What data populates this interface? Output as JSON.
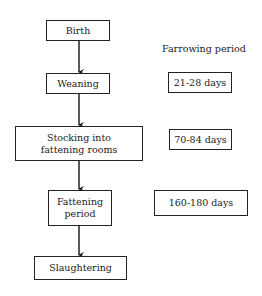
{
  "flow": {
    "steps": [
      {
        "label": "Birth"
      },
      {
        "label": "Weaning"
      },
      {
        "label": "Stocking into fattening rooms"
      },
      {
        "label": "Fattening period"
      },
      {
        "label": "Slaughtering"
      }
    ]
  },
  "durations": {
    "heading": "Farrowing period",
    "items": [
      {
        "label": "21-28 days"
      },
      {
        "label": "70-84 days"
      },
      {
        "label": "160-180 days"
      }
    ]
  }
}
